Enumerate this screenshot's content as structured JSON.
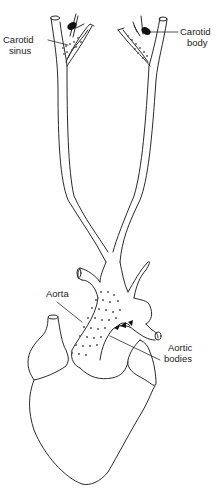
{
  "diagram": {
    "colors": {
      "line": "#2a2a2a",
      "dots": "#555555",
      "receptor_fill": "#111111",
      "background": "#ffffff"
    },
    "labels": {
      "carotid_sinus": {
        "line1": "Carotid",
        "line2": "sinus"
      },
      "carotid_body": {
        "line1": "Carotid",
        "line2": "body"
      },
      "aorta": {
        "line1": "Aorta"
      },
      "aortic_bodies": {
        "line1": "Aortic",
        "line2": "bodies"
      }
    }
  }
}
